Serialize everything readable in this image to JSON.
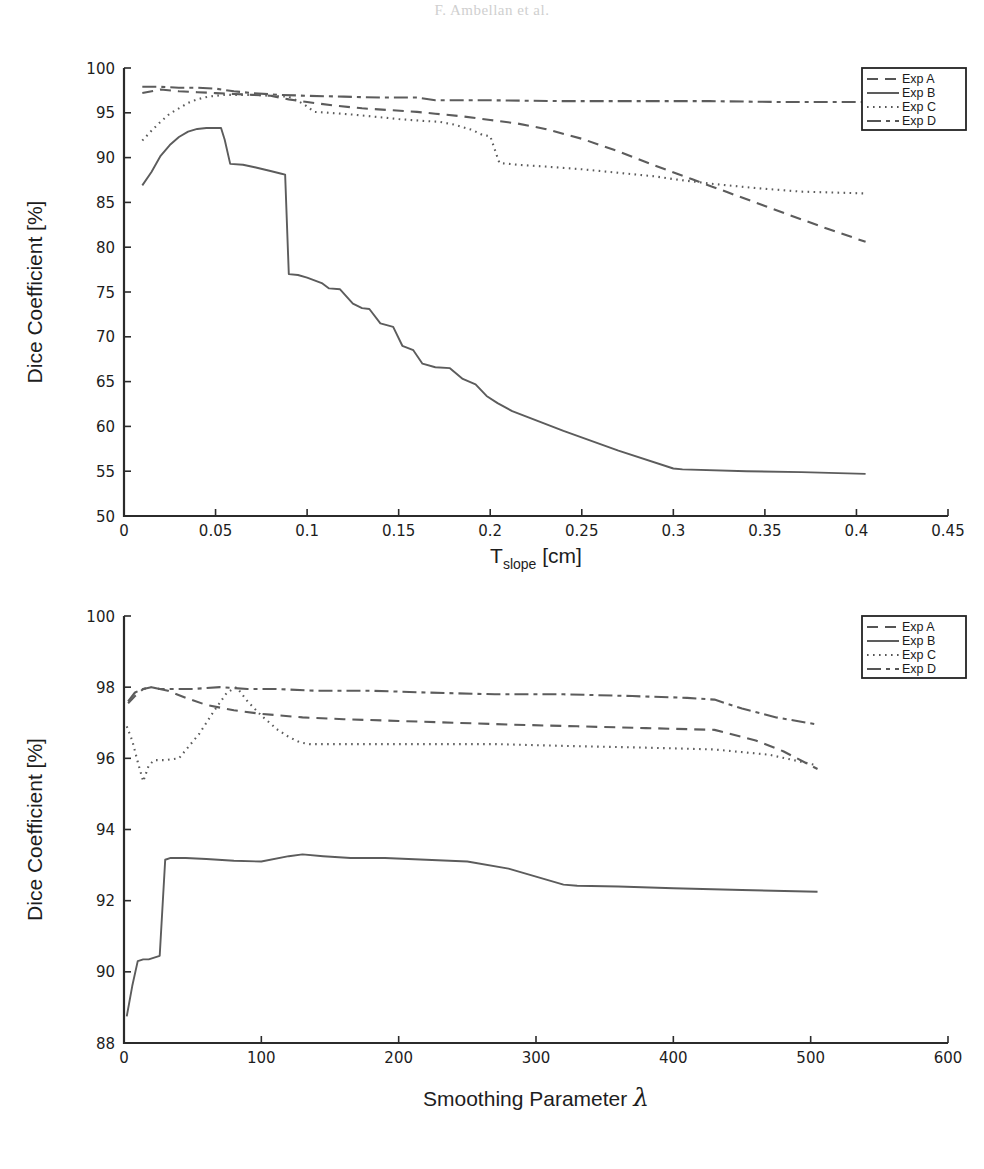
{
  "page": {
    "header_text": "F. Ambellan et al."
  },
  "figures": [
    {
      "id": "fig-top",
      "name": "dice-vs-tslope-chart",
      "chart_data": {
        "type": "line",
        "title": "",
        "xlabel": "T_slope [cm]",
        "xlabel_main": "T",
        "xlabel_sub": "slope",
        "xlabel_unit": "[cm]",
        "ylabel": "Dice Coefficient [%]",
        "xlim": [
          0,
          0.45
        ],
        "ylim": [
          50,
          100
        ],
        "xticks": [
          0,
          0.05,
          0.1,
          0.15,
          0.2,
          0.25,
          0.3,
          0.35,
          0.4,
          0.45
        ],
        "xticklabels": [
          "0",
          "0.05",
          "0.1",
          "0.15",
          "0.2",
          "0.25",
          "0.3",
          "0.35",
          "0.4",
          "0.45"
        ],
        "yticks": [
          50,
          55,
          60,
          65,
          70,
          75,
          80,
          85,
          90,
          95,
          100
        ],
        "yticklabels": [
          "50",
          "55",
          "60",
          "65",
          "70",
          "75",
          "80",
          "85",
          "90",
          "95",
          "100"
        ],
        "grid": false,
        "legend_position": "top-right",
        "series": [
          {
            "name": "Exp A",
            "style": "dashed",
            "dash": "11,7",
            "x": [
              0.01,
              0.02,
              0.03,
              0.04,
              0.05,
              0.06,
              0.07,
              0.08,
              0.09,
              0.1,
              0.115,
              0.13,
              0.145,
              0.16,
              0.17,
              0.185,
              0.2,
              0.215,
              0.23,
              0.25,
              0.27,
              0.29,
              0.31,
              0.33,
              0.35,
              0.37,
              0.385,
              0.405
            ],
            "y": [
              97.2,
              97.6,
              97.4,
              97.3,
              97.2,
              97.1,
              97.0,
              96.9,
              96.5,
              96.2,
              95.8,
              95.5,
              95.3,
              95.1,
              94.9,
              94.6,
              94.2,
              93.8,
              93.2,
              92.1,
              90.7,
              89.1,
              87.6,
              86.1,
              84.6,
              83.1,
              82.0,
              80.6
            ]
          },
          {
            "name": "Exp B",
            "style": "solid",
            "dash": "none",
            "x": [
              0.01,
              0.015,
              0.02,
              0.025,
              0.03,
              0.035,
              0.04,
              0.045,
              0.05,
              0.053,
              0.055,
              0.058,
              0.065,
              0.072,
              0.08,
              0.086,
              0.088,
              0.09,
              0.095,
              0.1,
              0.108,
              0.112,
              0.118,
              0.125,
              0.13,
              0.134,
              0.14,
              0.147,
              0.152,
              0.158,
              0.163,
              0.17,
              0.178,
              0.185,
              0.192,
              0.198,
              0.204,
              0.212,
              0.24,
              0.27,
              0.3,
              0.305,
              0.34,
              0.37,
              0.405
            ],
            "y": [
              86.9,
              88.4,
              90.2,
              91.4,
              92.3,
              92.9,
              93.2,
              93.3,
              93.3,
              93.3,
              92.0,
              89.3,
              89.2,
              88.9,
              88.5,
              88.2,
              88.1,
              77.0,
              76.9,
              76.6,
              76.0,
              75.4,
              75.3,
              73.7,
              73.2,
              73.1,
              71.5,
              71.1,
              69.0,
              68.5,
              67.0,
              66.6,
              66.5,
              65.3,
              64.7,
              63.4,
              62.6,
              61.7,
              59.5,
              57.3,
              55.3,
              55.2,
              55.0,
              54.9,
              54.7
            ]
          },
          {
            "name": "Exp C",
            "style": "dotted",
            "dash": "1.6,4.4",
            "x": [
              0.01,
              0.015,
              0.02,
              0.025,
              0.03,
              0.035,
              0.04,
              0.046,
              0.05,
              0.055,
              0.06,
              0.07,
              0.08,
              0.09,
              0.098,
              0.104,
              0.112,
              0.125,
              0.135,
              0.15,
              0.163,
              0.172,
              0.18,
              0.19,
              0.196,
              0.2,
              0.205,
              0.215,
              0.23,
              0.25,
              0.27,
              0.29,
              0.3,
              0.32,
              0.345,
              0.37,
              0.405
            ],
            "y": [
              91.9,
              93.0,
              94.0,
              94.9,
              95.5,
              96.1,
              96.5,
              96.8,
              96.9,
              97.0,
              97.0,
              97.0,
              96.9,
              96.8,
              96.0,
              95.1,
              95.0,
              94.8,
              94.6,
              94.3,
              94.1,
              94.0,
              93.7,
              93.1,
              92.5,
              92.4,
              89.4,
              89.2,
              89.0,
              88.7,
              88.3,
              87.9,
              87.6,
              87.1,
              86.6,
              86.2,
              86.0
            ]
          },
          {
            "name": "Exp D",
            "style": "dashdot",
            "dash": "14,5,4,5",
            "x": [
              0.01,
              0.02,
              0.03,
              0.04,
              0.05,
              0.06,
              0.07,
              0.085,
              0.1,
              0.12,
              0.14,
              0.16,
              0.17,
              0.2,
              0.24,
              0.28,
              0.32,
              0.36,
              0.405
            ],
            "y": [
              97.9,
              97.9,
              97.8,
              97.8,
              97.7,
              97.4,
              97.2,
              97.0,
              96.9,
              96.8,
              96.7,
              96.7,
              96.4,
              96.4,
              96.3,
              96.3,
              96.3,
              96.2,
              96.2
            ]
          }
        ]
      }
    },
    {
      "id": "fig-bottom",
      "name": "dice-vs-smoothing-chart",
      "chart_data": {
        "type": "line",
        "title": "",
        "xlabel": "Smoothing Parameter λ",
        "xlabel_main": "Smoothing Parameter",
        "xlabel_sym": "λ",
        "ylabel": "Dice Coefficient [%]",
        "xlim": [
          0,
          600
        ],
        "ylim": [
          88,
          100
        ],
        "xticks": [
          0,
          100,
          200,
          300,
          400,
          500,
          600
        ],
        "xticklabels": [
          "0",
          "100",
          "200",
          "300",
          "400",
          "500",
          "600"
        ],
        "yticks": [
          88,
          90,
          92,
          94,
          96,
          98,
          100
        ],
        "yticklabels": [
          "88",
          "90",
          "92",
          "94",
          "96",
          "98",
          "100"
        ],
        "grid": false,
        "legend_position": "top-right",
        "series": [
          {
            "name": "Exp A",
            "style": "dashed",
            "dash": "11,7",
            "x": [
              3,
              8,
              14,
              20,
              26,
              32,
              45,
              60,
              80,
              100,
              130,
              160,
              200,
              240,
              280,
              330,
              380,
              430,
              460,
              480,
              505
            ],
            "y": [
              97.55,
              97.75,
              97.95,
              98.0,
              97.95,
              97.9,
              97.7,
              97.5,
              97.35,
              97.25,
              97.15,
              97.1,
              97.05,
              97.0,
              96.95,
              96.9,
              96.85,
              96.8,
              96.5,
              96.2,
              95.7
            ]
          },
          {
            "name": "Exp B",
            "style": "solid",
            "dash": "none",
            "x": [
              2,
              6,
              10,
              14,
              18,
              22,
              26,
              30,
              34,
              45,
              60,
              80,
              100,
              120,
              130,
              145,
              165,
              190,
              220,
              250,
              280,
              320,
              330,
              360,
              400,
              450,
              505
            ],
            "y": [
              88.75,
              89.6,
              90.3,
              90.35,
              90.35,
              90.4,
              90.45,
              93.15,
              93.2,
              93.2,
              93.17,
              93.12,
              93.1,
              93.25,
              93.3,
              93.25,
              93.2,
              93.2,
              93.15,
              93.1,
              92.9,
              92.45,
              92.42,
              92.4,
              92.35,
              92.3,
              92.25
            ]
          },
          {
            "name": "Exp C",
            "style": "dotted",
            "dash": "1.6,4.4",
            "x": [
              2,
              6,
              10,
              14,
              18,
              22,
              30,
              40,
              55,
              65,
              75,
              82,
              90,
              100,
              112,
              120,
              128,
              135,
              150,
              180,
              220,
              270,
              320,
              380,
              430,
              470,
              505
            ],
            "y": [
              96.9,
              96.5,
              95.9,
              95.35,
              95.8,
              95.95,
              95.95,
              96.0,
              96.7,
              97.3,
              97.85,
              98.0,
              97.6,
              97.2,
              96.8,
              96.6,
              96.45,
              96.4,
              96.4,
              96.4,
              96.4,
              96.4,
              96.35,
              96.3,
              96.25,
              96.1,
              95.8
            ]
          },
          {
            "name": "Exp D",
            "style": "dashdot",
            "dash": "14,5,4,5",
            "x": [
              3,
              8,
              14,
              20,
              26,
              35,
              50,
              70,
              90,
              110,
              140,
              180,
              220,
              270,
              320,
              370,
              410,
              430,
              450,
              475,
              505
            ],
            "y": [
              97.6,
              97.85,
              97.95,
              98.0,
              97.95,
              97.95,
              97.95,
              98.0,
              97.95,
              97.95,
              97.9,
              97.9,
              97.85,
              97.8,
              97.8,
              97.75,
              97.7,
              97.65,
              97.4,
              97.15,
              96.95
            ]
          }
        ]
      }
    }
  ],
  "legend": {
    "items": [
      {
        "label": "Exp A",
        "style": "dashed"
      },
      {
        "label": "Exp B",
        "style": "solid"
      },
      {
        "label": "Exp C",
        "style": "dotted"
      },
      {
        "label": "Exp D",
        "style": "dashdot"
      }
    ]
  }
}
